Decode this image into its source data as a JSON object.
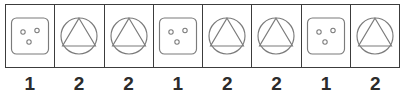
{
  "figure": {
    "name": "shape-sequence-strip",
    "cell_count": 8,
    "colors": {
      "background": "#ffffff",
      "cell_border": "#3c3c3c",
      "glyph_stroke": "#7b7b7b",
      "label_text": "#2b2b2b"
    },
    "glyph_types": {
      "dotted_square": "rounded square containing three small circles arranged in a triangle",
      "circle_triangle": "circle with an inscribed triangle, apex at top"
    },
    "cells": [
      {
        "index": 1,
        "glyph": "dotted-square",
        "glyph_label": "rounded square with three dots",
        "label": "1"
      },
      {
        "index": 2,
        "glyph": "circle-triangle",
        "glyph_label": "circle with inscribed triangle",
        "label": "2"
      },
      {
        "index": 3,
        "glyph": "circle-triangle",
        "glyph_label": "circle with inscribed triangle",
        "label": "2"
      },
      {
        "index": 4,
        "glyph": "dotted-square",
        "glyph_label": "rounded square with three dots",
        "label": "1"
      },
      {
        "index": 5,
        "glyph": "circle-triangle",
        "glyph_label": "circle with inscribed triangle",
        "label": "2"
      },
      {
        "index": 6,
        "glyph": "circle-triangle",
        "glyph_label": "circle with inscribed triangle",
        "label": "2"
      },
      {
        "index": 7,
        "glyph": "dotted-square",
        "glyph_label": "rounded square with three dots",
        "label": "1"
      },
      {
        "index": 8,
        "glyph": "circle-triangle",
        "glyph_label": "circle with inscribed triangle",
        "label": "2"
      }
    ],
    "label_sequence": "1 2 2 1 2 2 1 2"
  }
}
